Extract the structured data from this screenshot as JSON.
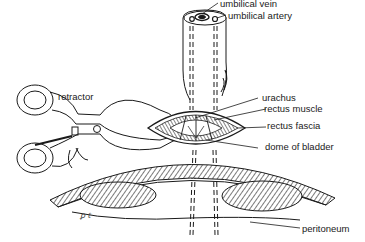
{
  "diagram": {
    "labels": {
      "umbilical_vein": "umbilical vein",
      "umbilical_artery": "umbilical artery",
      "retractor": "retractor",
      "urachus": "urachus",
      "rectus_muscle": "rectus muscle",
      "rectus_fascia": "rectus fascia",
      "dome_of_bladder": "dome of bladder",
      "peritoneum": "peritoneum"
    },
    "signature": "ꝑ ℓ",
    "colors": {
      "ink": "#1a1a1a",
      "background": "#ffffff",
      "hatch": "#555555"
    }
  }
}
